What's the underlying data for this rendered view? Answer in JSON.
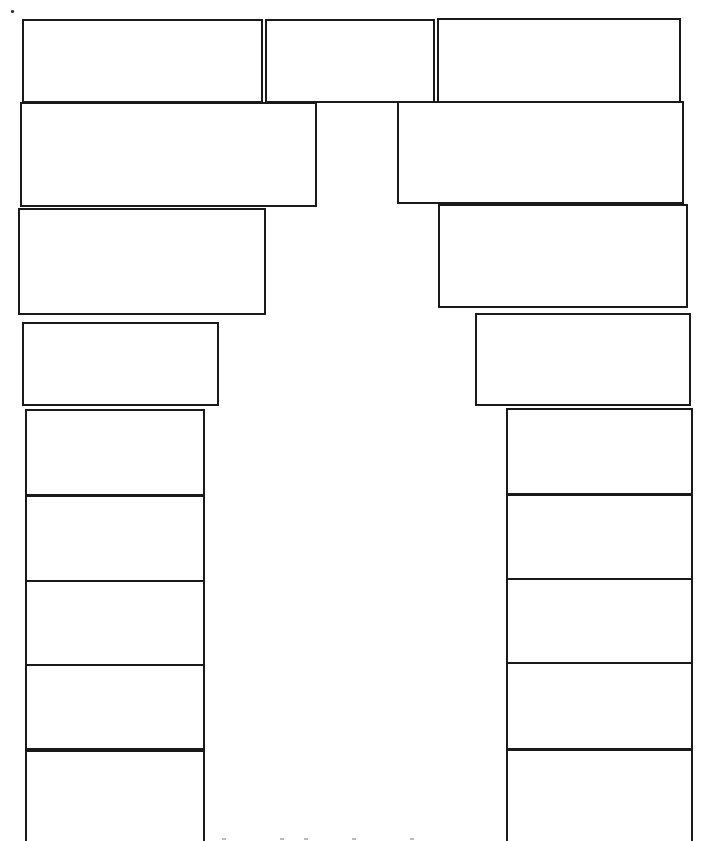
{
  "diagram": {
    "stroke_color": "#1a1a1a",
    "background_color": "#ffffff",
    "labels": [],
    "caption_visible_text": "",
    "boxes": {
      "top_row": [
        {
          "id": "top-left",
          "x": 22,
          "y": 19,
          "w": 241,
          "h": 84,
          "text": ""
        },
        {
          "id": "top-center",
          "x": 265,
          "y": 19,
          "w": 170,
          "h": 84,
          "text": ""
        },
        {
          "id": "top-right",
          "x": 437,
          "y": 18,
          "w": 244,
          "h": 85,
          "text": ""
        }
      ],
      "left_stack": [
        {
          "id": "left-2",
          "x": 20,
          "y": 102,
          "w": 297,
          "h": 105,
          "text": ""
        },
        {
          "id": "left-3",
          "x": 18,
          "y": 208,
          "w": 248,
          "h": 107,
          "text": ""
        },
        {
          "id": "left-4",
          "x": 22,
          "y": 322,
          "w": 197,
          "h": 84,
          "text": ""
        }
      ],
      "right_stack": [
        {
          "id": "right-2",
          "x": 397,
          "y": 101,
          "w": 287,
          "h": 103,
          "text": ""
        },
        {
          "id": "right-3",
          "x": 438,
          "y": 204,
          "w": 250,
          "h": 104,
          "text": ""
        },
        {
          "id": "right-4",
          "x": 475,
          "y": 313,
          "w": 216,
          "h": 93,
          "text": ""
        }
      ],
      "left_column": [
        {
          "id": "left-col-1",
          "x": 25,
          "y": 409,
          "w": 180,
          "h": 86,
          "text": ""
        },
        {
          "id": "left-col-2",
          "x": 25,
          "y": 496,
          "w": 180,
          "h": 86,
          "text": ""
        },
        {
          "id": "left-col-3",
          "x": 25,
          "y": 580,
          "w": 180,
          "h": 86,
          "text": ""
        },
        {
          "id": "left-col-4",
          "x": 25,
          "y": 664,
          "w": 180,
          "h": 85,
          "text": ""
        },
        {
          "id": "left-col-5",
          "x": 25,
          "y": 750,
          "w": 180,
          "h": 91,
          "text": "",
          "open_bottom": true
        }
      ],
      "right_column": [
        {
          "id": "right-col-1",
          "x": 506,
          "y": 408,
          "w": 187,
          "h": 87,
          "text": ""
        },
        {
          "id": "right-col-2",
          "x": 506,
          "y": 494,
          "w": 187,
          "h": 86,
          "text": ""
        },
        {
          "id": "right-col-3",
          "x": 506,
          "y": 578,
          "w": 187,
          "h": 86,
          "text": ""
        },
        {
          "id": "right-col-4",
          "x": 506,
          "y": 662,
          "w": 187,
          "h": 87,
          "text": ""
        },
        {
          "id": "right-col-5",
          "x": 506,
          "y": 749,
          "w": 187,
          "h": 92,
          "text": "",
          "open_bottom": true
        }
      ]
    }
  }
}
